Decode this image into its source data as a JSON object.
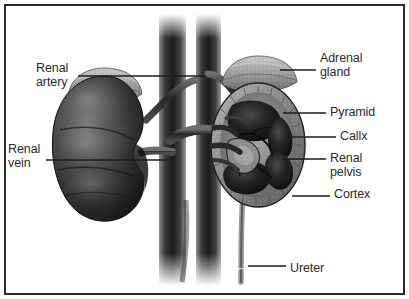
{
  "figure": {
    "background_color": "#ffffff",
    "border_color": "#2b2b2b",
    "text_color": "#2a2a2a"
  },
  "labels": [
    {
      "id": "renal-artery",
      "text": "Renal\nartery",
      "side": "left",
      "x": 36,
      "y": 62
    },
    {
      "id": "renal-vein",
      "text": "Renal\nvein",
      "side": "left",
      "x": 8,
      "y": 143
    },
    {
      "id": "adrenal-gland",
      "text": "Adrenal\ngland",
      "side": "right",
      "x": 320,
      "y": 52
    },
    {
      "id": "pyramid",
      "text": "Pyramid",
      "side": "right",
      "x": 330,
      "y": 106
    },
    {
      "id": "callx",
      "text": "Callx",
      "side": "right",
      "x": 340,
      "y": 130
    },
    {
      "id": "renal-pelvis",
      "text": "Renal\npelvis",
      "side": "right",
      "x": 330,
      "y": 152
    },
    {
      "id": "cortex",
      "text": "Cortex",
      "side": "right",
      "x": 334,
      "y": 188
    },
    {
      "id": "ureter",
      "text": "Ureter",
      "side": "right",
      "x": 290,
      "y": 262
    }
  ],
  "leader_lines": [
    {
      "id": "leader-renal-artery",
      "x1": 78,
      "y1": 76,
      "x2": 206,
      "y2": 76
    },
    {
      "id": "leader-renal-vein",
      "x1": 46,
      "y1": 160,
      "x2": 168,
      "y2": 160
    },
    {
      "id": "leader-adrenal-gland",
      "x1": 280,
      "y1": 70,
      "x2": 316,
      "y2": 70
    },
    {
      "id": "leader-pyramid",
      "x1": 283,
      "y1": 113,
      "x2": 326,
      "y2": 113
    },
    {
      "id": "leader-callx",
      "x1": 286,
      "y1": 137,
      "x2": 336,
      "y2": 137
    },
    {
      "id": "leader-renal-pelvis",
      "x1": 283,
      "y1": 159,
      "x2": 326,
      "y2": 159
    },
    {
      "id": "leader-cortex",
      "x1": 292,
      "y1": 196,
      "x2": 330,
      "y2": 196
    },
    {
      "id": "leader-ureter",
      "x1": 248,
      "y1": 266,
      "x2": 286,
      "y2": 266
    }
  ],
  "structures": {
    "left_kidney": {
      "name": "whole kidney",
      "shading": "dark bean shape"
    },
    "right_kidney": {
      "name": "sectioned kidney",
      "shading": "cross-section with pyramids"
    },
    "adrenal_glands": {
      "count": 2
    },
    "vessels": {
      "names": [
        "aorta",
        "inferior vena cava"
      ],
      "count": 2
    },
    "ureter": {
      "count": 1
    }
  }
}
